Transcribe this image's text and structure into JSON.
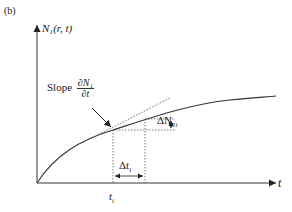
{
  "figure": {
    "panel_label": "(b)",
    "y_axis_label": "N₁(r, t)",
    "x_axis_label": "t",
    "x_tick_label": "t",
    "x_tick_sub": "i",
    "slope_label": "Slope",
    "slope_num": "∂N₁",
    "slope_den": "∂t",
    "delta_N_label": "ΔN",
    "delta_N_sub": "1i",
    "delta_t_label": "Δt",
    "delta_t_sub": "i"
  },
  "colors": {
    "line": "#333333",
    "dotted": "#555555",
    "background": "#ffffff"
  }
}
